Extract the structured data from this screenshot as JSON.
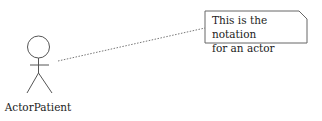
{
  "diagram": {
    "type": "uml-use-case",
    "actor": {
      "label": "ActorPatient"
    },
    "note": {
      "line1": "This is the notation",
      "line2": "for an actor"
    },
    "colors": {
      "stroke": "#555555",
      "text": "#222222",
      "background": "#ffffff"
    }
  }
}
